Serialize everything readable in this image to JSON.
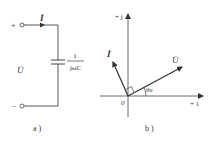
{
  "figure_a": {
    "caption": "a )",
    "terminal_plus": "+",
    "terminal_minus": "−",
    "current_label": "İ",
    "voltage_label": "U̇",
    "impedance_numerator": "1",
    "impedance_denominator": "jωC"
  },
  "figure_b": {
    "caption": "b )",
    "imag_axis_label": "+ j",
    "real_axis_label": "+ 1",
    "origin_label": "0",
    "current_phasor_label": "İ",
    "voltage_phasor_label": "U̇",
    "angle_label": "θu"
  },
  "colors": {
    "line": "#444444",
    "text": "#333333",
    "background": "#ffffff"
  }
}
